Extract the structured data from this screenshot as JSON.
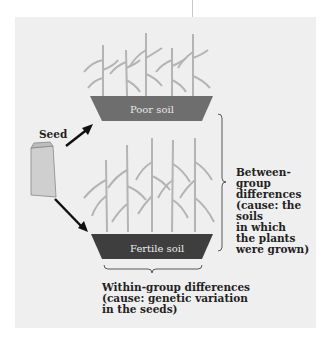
{
  "diagram": {
    "seed_label": "Seed",
    "poor_tray_label": "Poor soil",
    "fertile_tray_label": "Fertile soil",
    "between_group": [
      "Between-group",
      "differences",
      "(cause: the soils",
      "in which",
      "the plants",
      "were grown)"
    ],
    "within_group": [
      "Within-group differences",
      "(cause: genetic variation",
      "in the seeds)"
    ],
    "colors": {
      "background": "#efefef",
      "poor_tray": "#6e6e6e",
      "fertile_tray": "#3e3e3e",
      "plant": "#b4b4b4",
      "arrow": "#111111",
      "bag": "#cfcfcf"
    }
  }
}
